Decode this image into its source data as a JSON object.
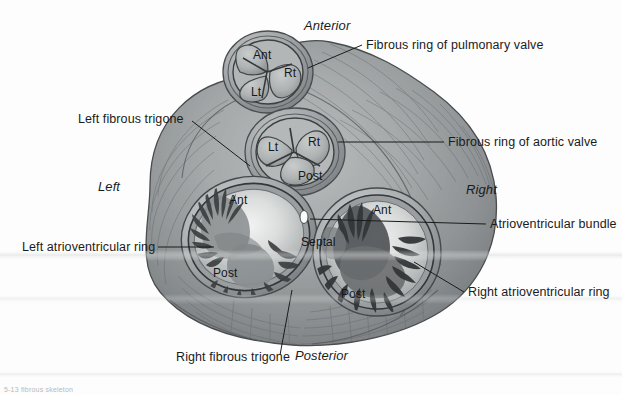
{
  "figure": {
    "background_color": "#fdfdfd",
    "ink_color": "#1b1b1b"
  },
  "orientation_labels": [
    {
      "name": "anterior",
      "text": "Anterior",
      "x": 304,
      "y": 18
    },
    {
      "name": "posterior",
      "text": "Posterior",
      "x": 295,
      "y": 348
    },
    {
      "name": "left",
      "text": "Left",
      "x": 98,
      "y": 179
    },
    {
      "name": "right",
      "text": "Right",
      "x": 466,
      "y": 182
    }
  ],
  "callouts": [
    {
      "name": "fibrous-ring-of-pulmonary-valve",
      "text": "Fibrous ring of pulmonary valve",
      "x": 366,
      "y": 38,
      "leader": {
        "x1": 362,
        "y1": 45,
        "x2": 308,
        "y2": 68
      }
    },
    {
      "name": "fibrous-ring-of-aortic-valve",
      "text": "Fibrous ring of aortic valve",
      "x": 448,
      "y": 135,
      "leader": {
        "x1": 444,
        "y1": 142,
        "x2": 338,
        "y2": 142
      }
    },
    {
      "name": "atrioventricular-bundle",
      "text": "Atrioventricular bundle",
      "x": 490,
      "y": 217,
      "leader": {
        "x1": 486,
        "y1": 224,
        "x2": 310,
        "y2": 219
      }
    },
    {
      "name": "right-atrioventricular-ring",
      "text": "Right atrioventricular ring",
      "x": 468,
      "y": 291,
      "leader": {
        "x1": 464,
        "y1": 292,
        "x2": 414,
        "y2": 262
      }
    },
    {
      "name": "left-fibrous-trigone",
      "text": "Left fibrous trigone",
      "x": 78,
      "y": 112,
      "leader": {
        "x1": 192,
        "y1": 121,
        "x2": 250,
        "y2": 166
      }
    },
    {
      "name": "left-atrioventricular-ring",
      "text": "Left atrioventricular ring",
      "x": 22,
      "y": 240,
      "leader": {
        "x1": 158,
        "y1": 247,
        "x2": 212,
        "y2": 247
      }
    },
    {
      "name": "right-fibrous-trigone",
      "text": "Right fibrous trigone",
      "x": 176,
      "y": 357,
      "leader": {
        "x1": 280,
        "y1": 355,
        "x2": 290,
        "y2": 291
      }
    }
  ],
  "valves": [
    {
      "name": "pulmonary-valve",
      "label": "Pulmonary valve",
      "cusps": [
        {
          "name": "cusp-ant",
          "text": "Ant",
          "x": 253,
          "y": 54
        },
        {
          "name": "cusp-rt",
          "text": "Rt",
          "x": 284,
          "y": 73
        },
        {
          "name": "cusp-lt",
          "text": "Lt",
          "x": 251,
          "y": 91
        }
      ]
    },
    {
      "name": "aortic-valve",
      "label": "Aortic valve",
      "cusps": [
        {
          "name": "cusp-lt",
          "text": "Lt",
          "x": 270,
          "y": 146
        },
        {
          "name": "cusp-rt",
          "text": "Rt",
          "x": 310,
          "y": 141
        },
        {
          "name": "cusp-post",
          "text": "Post",
          "x": 302,
          "y": 175
        }
      ]
    },
    {
      "name": "left-atrioventricular-valve",
      "label": "Left atrioventricular (mitral) valve",
      "cusps": [
        {
          "name": "cusp-ant",
          "text": "Ant",
          "x": 231,
          "y": 199
        },
        {
          "name": "cusp-post",
          "text": "Post",
          "x": 218,
          "y": 272
        }
      ]
    },
    {
      "name": "right-atrioventricular-valve",
      "label": "Right atrioventricular (tricuspid) valve",
      "cusps": [
        {
          "name": "cusp-ant",
          "text": "Ant",
          "x": 375,
          "y": 209
        },
        {
          "name": "cusp-septal",
          "text": "Septal",
          "x": 308,
          "y": 241
        },
        {
          "name": "cusp-post",
          "text": "Post",
          "x": 345,
          "y": 293
        }
      ]
    }
  ],
  "caption": {
    "name": "figure-caption",
    "text": "5-13  fibrous skeleton"
  }
}
